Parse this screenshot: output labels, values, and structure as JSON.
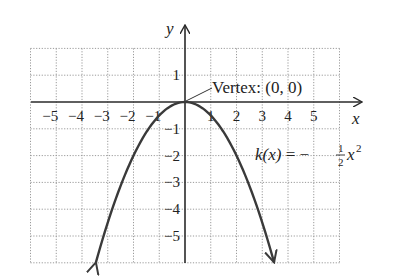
{
  "chart_data": {
    "type": "line",
    "title": "",
    "xlabel": "x",
    "ylabel": "y",
    "xlim": [
      -6,
      6
    ],
    "ylim": [
      -6,
      2
    ],
    "grid": true,
    "x_ticks": [
      -5,
      -4,
      -3,
      -2,
      -1,
      1,
      2,
      3,
      4,
      5
    ],
    "y_ticks": [
      1,
      -1,
      -2,
      -3,
      -4,
      -5
    ],
    "series": [
      {
        "name": "k(x) = -1/2 x^2",
        "function": "-0.5*x^2",
        "x": [
          -3.46,
          -3,
          -2,
          -1,
          0,
          1,
          2,
          3,
          3.46
        ],
        "y": [
          -6,
          -4.5,
          -2,
          -0.5,
          0,
          -0.5,
          -2,
          -4.5,
          -6
        ]
      }
    ],
    "annotations": [
      {
        "text": "Vertex: (0, 0)",
        "point": [
          0,
          0
        ]
      },
      {
        "text": "k(x) = -1/2 x^2"
      }
    ]
  },
  "labels": {
    "x_axis": "x",
    "y_axis": "y",
    "vertex": "Vertex: (0, 0)",
    "formula_lhs": "k(x)",
    "formula_eq": " = −",
    "formula_num": "1",
    "formula_den": "2",
    "formula_var": "x",
    "formula_exp": "2",
    "x_ticks": [
      "−5",
      "−4",
      "−3",
      "−2",
      "−1",
      "1",
      "2",
      "3",
      "4",
      "5"
    ],
    "y_ticks": [
      "1",
      "−1",
      "−2",
      "−3",
      "−4",
      "−5"
    ]
  }
}
